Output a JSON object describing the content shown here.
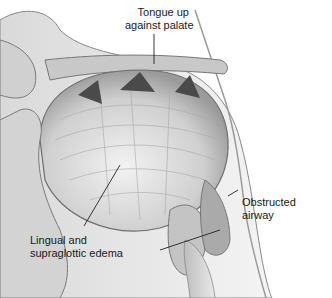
{
  "figure": {
    "type": "anatomical-illustration",
    "labels": {
      "tongue_line1": "Tongue up",
      "tongue_line2": "against palate",
      "edema_line1": "Lingual and",
      "edema_line2": "supraglottic edema",
      "airway_line1": "Obstructed",
      "airway_line2": "airway"
    }
  }
}
